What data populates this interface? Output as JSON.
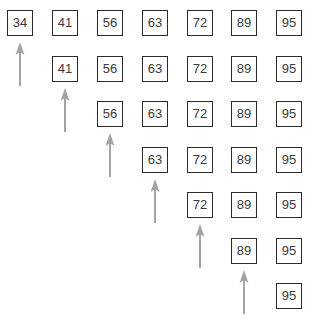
{
  "diagram": {
    "type": "sorted-array-pointer-sweep",
    "arrow_color": "#a3a3a3",
    "box_border_color": "#2b2b2b",
    "text_color": "#3a3a3a",
    "rows": [
      {
        "values": [
          "34",
          "41",
          "56",
          "63",
          "72",
          "89",
          "95"
        ],
        "pointer_index": 0
      },
      {
        "values": [
          "41",
          "56",
          "63",
          "72",
          "89",
          "95"
        ],
        "pointer_index": 0
      },
      {
        "values": [
          "56",
          "63",
          "72",
          "89",
          "95"
        ],
        "pointer_index": 0
      },
      {
        "values": [
          "63",
          "72",
          "89",
          "95"
        ],
        "pointer_index": 0
      },
      {
        "values": [
          "72",
          "89",
          "95"
        ],
        "pointer_index": 0
      },
      {
        "values": [
          "89",
          "95"
        ],
        "pointer_index": 0
      },
      {
        "values": [
          "95"
        ],
        "pointer_index": null
      }
    ],
    "arrow_icon": "up-arrow-icon"
  }
}
